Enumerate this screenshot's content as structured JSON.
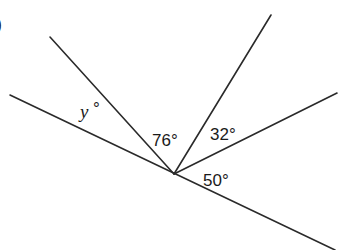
{
  "figure": {
    "partial_label": ")",
    "vertex": {
      "x": 174,
      "y": 174
    },
    "lines": [
      {
        "name": "baseline",
        "x1": 10,
        "y1": 95,
        "x2": 335,
        "y2": 250
      },
      {
        "name": "ray-upper-left",
        "x1": 174,
        "y1": 174,
        "x2": 50,
        "y2": 37
      },
      {
        "name": "ray-upper",
        "x1": 174,
        "y1": 174,
        "x2": 271,
        "y2": 15
      },
      {
        "name": "ray-right",
        "x1": 174,
        "y1": 174,
        "x2": 337,
        "y2": 93
      }
    ],
    "angles": {
      "y": {
        "label": "y",
        "degree": "°"
      },
      "a76": {
        "label": "76°"
      },
      "a32": {
        "label": "32°"
      },
      "a50": {
        "label": "50°"
      }
    },
    "color": "#2a2a2a"
  }
}
